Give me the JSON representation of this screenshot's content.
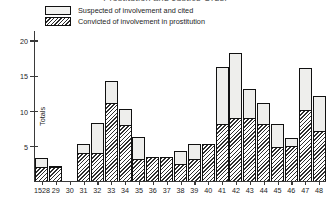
{
  "chart_data": {
    "type": "bar",
    "title": "Prostitution and Justice Order",
    "xlabel": "",
    "ylabel": "Totals",
    "ylim": [
      0,
      21
    ],
    "yticks": [
      5,
      10,
      15,
      20
    ],
    "grid": false,
    "legend_position": "top-left",
    "stacked": true,
    "categories": [
      "1528",
      "29",
      "30",
      "31",
      "32",
      "33",
      "34",
      "35",
      "36",
      "37",
      "38",
      "39",
      "40",
      "41",
      "42",
      "43",
      "44",
      "45",
      "46",
      "47",
      "48"
    ],
    "series": [
      {
        "name": "Suspected of involvement and cited",
        "swatch": "open",
        "values": [
          3.2,
          2.2,
          0,
          5.2,
          8.2,
          14.2,
          10.2,
          6.2,
          3.4,
          3.4,
          4.2,
          5.2,
          5.2,
          16.2,
          18.1,
          13.1,
          11.1,
          8.1,
          6.1,
          16.1,
          12.1
        ]
      },
      {
        "name": "Convicted of involvement in prostitution",
        "swatch": "hatch",
        "values": [
          2.0,
          2.0,
          0,
          4.0,
          4.0,
          11.0,
          8.0,
          3.1,
          3.4,
          3.4,
          2.4,
          3.1,
          5.2,
          8.1,
          9.0,
          9.0,
          8.1,
          4.8,
          5.0,
          10.1,
          7.1
        ]
      }
    ]
  },
  "legend": {
    "items": [
      {
        "label": "Suspected of involvement and cited"
      },
      {
        "label": "Convicted of involvement in prostitution"
      }
    ]
  },
  "axes": {
    "y_label": "Totals",
    "y_tick_labels": [
      "20",
      "15",
      "10",
      "5"
    ],
    "x_tick_labels": [
      "1528",
      "29",
      "30",
      "31",
      "32",
      "33",
      "34",
      "35",
      "36",
      "37",
      "38",
      "39",
      "40",
      "41",
      "42",
      "43",
      "44",
      "45",
      "46",
      "47",
      "48"
    ]
  },
  "colors": {
    "axis": "#3a3a3a",
    "bar_outline": "#111111",
    "bar_open_fill": "#eeeeec",
    "bar_hatch_ink": "#2f2f2f",
    "text": "#1d1d1d",
    "background": "#ffffff"
  }
}
